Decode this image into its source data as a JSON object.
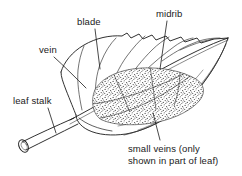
{
  "figure": {
    "type": "botanical-line-drawing",
    "subject": "leaf",
    "background_color": "#ffffff",
    "line_color": "#1a1a1a",
    "stipple_color": "#555555"
  },
  "labels": {
    "blade": "blade",
    "midrib": "midrib",
    "vein": "vein",
    "leaf_stalk": "leaf stalk",
    "small_veins_line1": "small veins (only",
    "small_veins_line2": "shown in part of leaf)"
  },
  "parts": [
    {
      "name": "blade",
      "label": "blade"
    },
    {
      "name": "midrib",
      "label": "midrib"
    },
    {
      "name": "vein",
      "label": "vein"
    },
    {
      "name": "leaf-stalk",
      "label": "leaf stalk"
    },
    {
      "name": "small-veins",
      "label": "small veins (only shown in part of leaf)"
    }
  ]
}
